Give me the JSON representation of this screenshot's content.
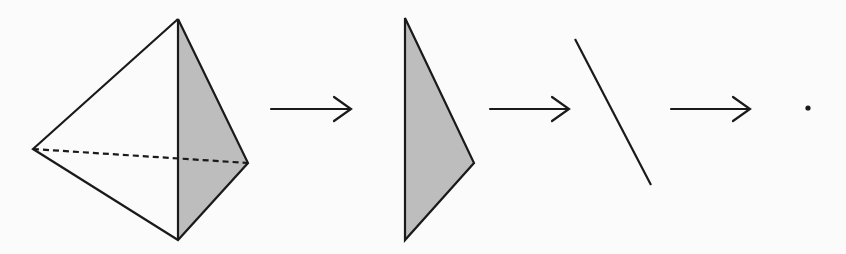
{
  "diagram": {
    "colors": {
      "stroke": "#1a1a1a",
      "shade": "#bdbdbd",
      "background": "#fbfbfb"
    },
    "stages": [
      {
        "name": "tetrahedron",
        "description": "3-simplex with one shaded face and a dashed hidden edge"
      },
      {
        "name": "triangle",
        "description": "shaded 2-simplex (face)"
      },
      {
        "name": "segment",
        "description": "1-simplex (edge)"
      },
      {
        "name": "point",
        "description": "0-simplex (vertex)"
      }
    ],
    "arrows": [
      {
        "from": "tetrahedron",
        "to": "triangle"
      },
      {
        "from": "triangle",
        "to": "segment"
      },
      {
        "from": "segment",
        "to": "point"
      }
    ]
  }
}
